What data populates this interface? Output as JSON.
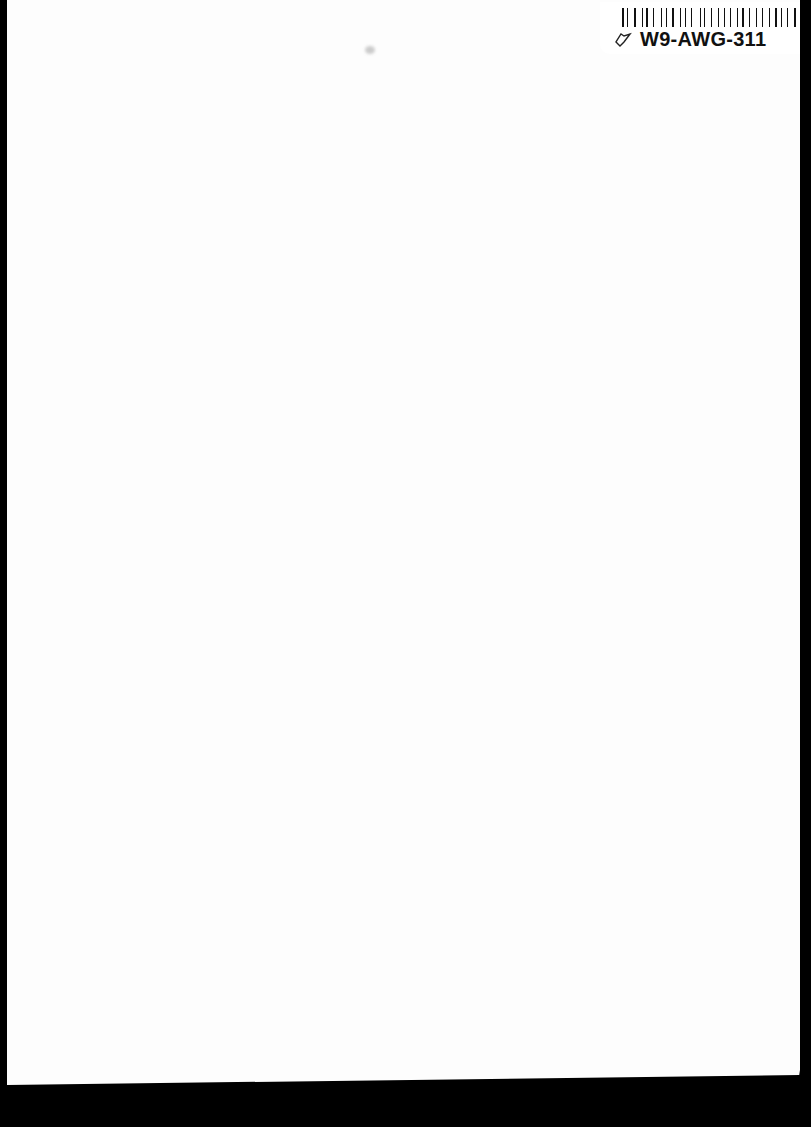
{
  "page": {
    "type": "scanned blank page",
    "background_color": "#fdfdfd",
    "scan_border_color": "#000000"
  },
  "label": {
    "code": "W9-AWG-311",
    "icon": "leaf-outline-icon",
    "barcode": "barcode"
  }
}
